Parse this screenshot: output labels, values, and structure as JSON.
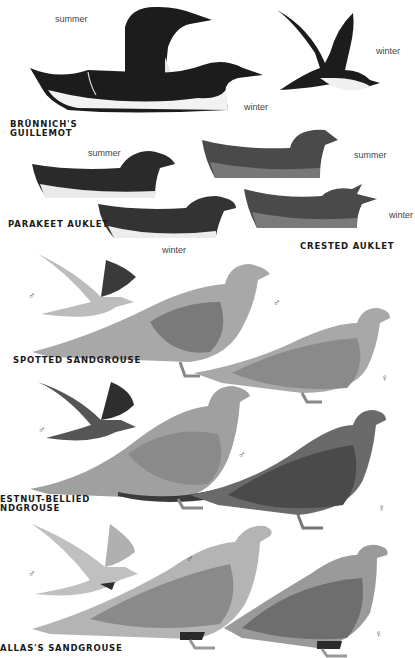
{
  "plate": {
    "species": [
      {
        "name_line1": "BRÜNNICH'S",
        "name_line2": "GUILLEMOT",
        "labels": [
          "summer",
          "winter",
          "winter"
        ]
      },
      {
        "name": "PARAKEET AUKLET",
        "labels": [
          "summer",
          "winter"
        ]
      },
      {
        "name": "CRESTED AUKLET",
        "labels": [
          "summer",
          "winter"
        ]
      },
      {
        "name": "SPOTTED SANDGROUSE",
        "labels": [
          "♂",
          "♂",
          "♀"
        ]
      },
      {
        "name_line1": "ESTNUT-BELLIED",
        "name_line2": "NDGROUSE",
        "labels": [
          "♂",
          "♂",
          "♀"
        ]
      },
      {
        "name": "ALLAS'S SANDGROUSE",
        "labels": [
          "♂",
          "♂",
          "♀"
        ]
      }
    ],
    "seasons": {
      "summer": "summer",
      "winter": "winter"
    },
    "symbols": {
      "male": "♂",
      "female": "♀"
    },
    "colors": {
      "background": "#ffffff",
      "dark_plumage": "#1e1e1e",
      "mid_plumage": "#6e6e6e",
      "sandgrouse": "#a8a8a8",
      "text": "#1a1a1a"
    }
  }
}
